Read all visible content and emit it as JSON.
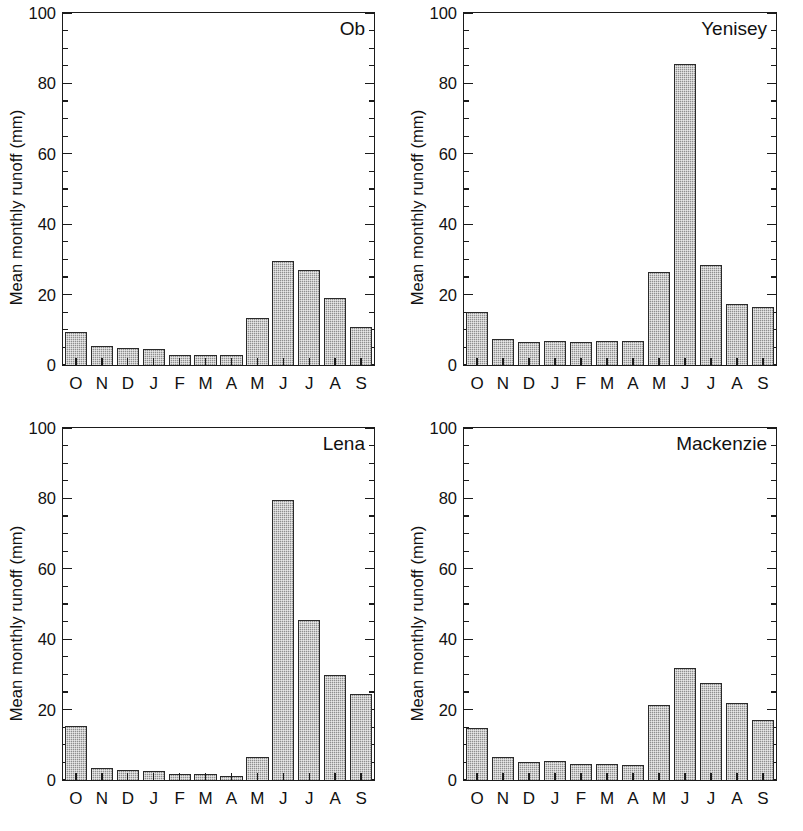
{
  "figure": {
    "layout": "2x2 grid of bar charts",
    "axis_title_y": "Mean monthly runoff (mm)",
    "y_ticks": [
      "0",
      "20",
      "40",
      "60",
      "80",
      "100"
    ],
    "x_ticks": [
      "O",
      "N",
      "D",
      "J",
      "F",
      "M",
      "A",
      "M",
      "J",
      "J",
      "A",
      "S"
    ],
    "colors": {
      "bar_fill": "#8e8e8e",
      "bar_edge": "#2a2a2a",
      "axis": "#1b1b1b",
      "background": "#ffffff",
      "text": "#111111"
    }
  },
  "panels": [
    {
      "title": "Ob"
    },
    {
      "title": "Yenisey"
    },
    {
      "title": "Lena"
    },
    {
      "title": "Mackenzie"
    }
  ],
  "chart_data": [
    {
      "type": "bar",
      "title": "Ob",
      "xlabel": "",
      "ylabel": "Mean monthly runoff (mm)",
      "ylim": [
        0,
        100
      ],
      "yticks": [
        0,
        20,
        40,
        60,
        80,
        100
      ],
      "yminor_step": 5,
      "grid": false,
      "legend": "none",
      "categories": [
        "O",
        "N",
        "D",
        "J",
        "F",
        "M",
        "A",
        "M",
        "J",
        "J",
        "A",
        "S"
      ],
      "values": [
        9,
        5,
        4.5,
        4,
        2.5,
        2.5,
        2.5,
        13,
        29,
        26.5,
        18.5,
        10.5
      ]
    },
    {
      "type": "bar",
      "title": "Yenisey",
      "xlabel": "",
      "ylabel": "Mean monthly runoff (mm)",
      "ylim": [
        0,
        100
      ],
      "yticks": [
        0,
        20,
        40,
        60,
        80,
        100
      ],
      "yminor_step": 5,
      "grid": false,
      "legend": "none",
      "categories": [
        "O",
        "N",
        "D",
        "J",
        "F",
        "M",
        "A",
        "M",
        "J",
        "J",
        "A",
        "S"
      ],
      "values": [
        14.5,
        7,
        6,
        6.5,
        6,
        6.5,
        6.5,
        26,
        85,
        28,
        17,
        16
      ]
    },
    {
      "type": "bar",
      "title": "Lena",
      "xlabel": "",
      "ylabel": "Mean monthly runoff (mm)",
      "ylim": [
        0,
        100
      ],
      "yticks": [
        0,
        20,
        40,
        60,
        80,
        100
      ],
      "yminor_step": 5,
      "grid": false,
      "legend": "none",
      "categories": [
        "O",
        "N",
        "D",
        "J",
        "F",
        "M",
        "A",
        "M",
        "J",
        "J",
        "A",
        "S"
      ],
      "values": [
        15,
        3,
        2.5,
        2.2,
        1.4,
        1.2,
        0.7,
        6,
        79,
        45,
        29.5,
        24
      ]
    },
    {
      "type": "bar",
      "title": "Mackenzie",
      "xlabel": "",
      "ylabel": "Mean monthly runoff (mm)",
      "ylim": [
        0,
        100
      ],
      "yticks": [
        0,
        20,
        40,
        60,
        80,
        100
      ],
      "yminor_step": 5,
      "grid": false,
      "legend": "none",
      "categories": [
        "O",
        "N",
        "D",
        "J",
        "F",
        "M",
        "A",
        "M",
        "J",
        "J",
        "A",
        "S"
      ],
      "values": [
        14.3,
        6.2,
        4.8,
        5,
        4,
        4,
        3.9,
        21,
        31.5,
        27,
        21.5,
        16.5
      ]
    }
  ]
}
